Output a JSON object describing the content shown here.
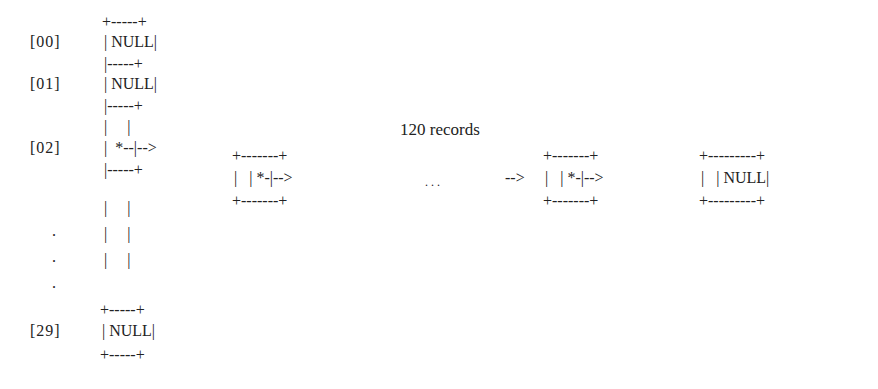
{
  "array": {
    "indices": [
      "[00]",
      "[01]",
      "[02]",
      ".",
      ".",
      ".",
      "[29]"
    ],
    "rows": [
      {
        "y": 14,
        "text": "+-----+"
      },
      {
        "y": 34,
        "text": "| NULL|"
      },
      {
        "y": 56,
        "text": "|-----+"
      },
      {
        "y": 76,
        "text": "| NULL|"
      },
      {
        "y": 98,
        "text": "|-----+"
      },
      {
        "y": 119,
        "text": "|     |"
      },
      {
        "y": 140,
        "text": "|  *--|-->"
      },
      {
        "y": 162,
        "text": "|-----+"
      },
      {
        "y": 183,
        "text": "|     |"
      },
      {
        "y": 209,
        "text": "|     |"
      },
      {
        "y": 235,
        "text": "|     |"
      },
      {
        "y": 259,
        "text": "+-----+"
      },
      {
        "y": 280,
        "text": "| NULL|"
      },
      {
        "y": 301,
        "text": "+-----+"
      }
    ]
  },
  "list": {
    "records_label": "120 records",
    "ellipsis": ". . .",
    "node1": {
      "top": "+-------+",
      "mid": "|   | *-|-->",
      "bot": "+-------+"
    },
    "arrow_in": "-->",
    "node2": {
      "top": "+-------+",
      "mid": "|   | *-|-->",
      "bot": "+-------+"
    },
    "node3": {
      "top": "+---------+",
      "mid": "|   | NULL|",
      "bot": "+---------+"
    }
  }
}
